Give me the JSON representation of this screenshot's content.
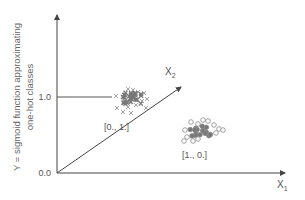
{
  "diagram": {
    "y_axis_label_line1": "Y = sigmoid function approximating",
    "y_axis_label_line2": "one-hot classes",
    "y_ticks": [
      "1.0",
      "0.0"
    ],
    "x1_axis": {
      "base": "X",
      "sub": "1"
    },
    "x2_axis": {
      "base": "X",
      "sub": "2"
    },
    "clusters": [
      {
        "name": "class-b",
        "marker": "x",
        "label": "[0., 1.]",
        "y_level": 1.0
      },
      {
        "name": "class-a",
        "marker": "o",
        "label": "[1., 0.]",
        "y_level": 0.0
      }
    ],
    "colors": {
      "axis": "#444444",
      "marker": "#8a8a8a",
      "marker_dense": "#777777",
      "text": "#555555"
    }
  }
}
